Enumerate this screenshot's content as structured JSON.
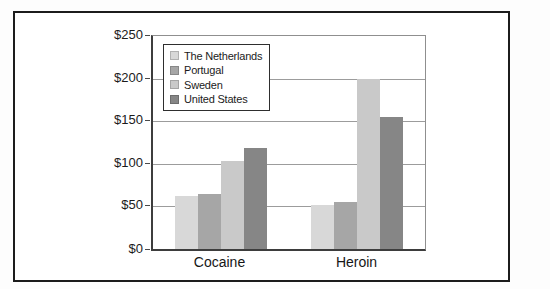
{
  "chart_data": {
    "type": "bar",
    "title": "",
    "categories": [
      "Cocaine",
      "Heroin"
    ],
    "series": [
      {
        "name": "The Netherlands",
        "color": "#d8d8d8",
        "values": [
          62,
          52
        ]
      },
      {
        "name": "Portugal",
        "color": "#a6a6a6",
        "values": [
          65,
          55
        ]
      },
      {
        "name": "Sweden",
        "color": "#c9c9c9",
        "values": [
          103,
          199
        ]
      },
      {
        "name": "United States",
        "color": "#868686",
        "values": [
          119,
          155
        ]
      }
    ],
    "ylabel": "",
    "xlabel": "",
    "ylim": [
      0,
      250
    ],
    "ytick_values": [
      250,
      200,
      150,
      100,
      50,
      0
    ],
    "yticks": [
      "$250",
      "$200",
      "$150",
      "$100",
      "$50",
      "$0"
    ],
    "currency_prefix": "$",
    "grid": true,
    "legend_position": "top-left-inside"
  },
  "colors": {
    "background": "#ffffff",
    "frame_border": "#1c1c1c",
    "plot_axis": "#3d3d3d",
    "plot_border_light": "#8f8f8f",
    "gridline": "#9c9c9c",
    "text": "#1b1b1b"
  }
}
